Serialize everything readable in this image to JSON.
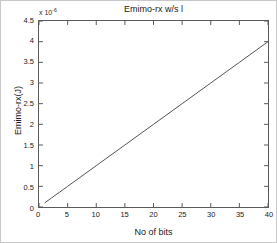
{
  "chart_data": {
    "type": "line",
    "title": "Emimo-rx w/s l",
    "xlabel": "No of bits",
    "ylabel": "Emimo-rx(J)",
    "y_multiplier_text": "x 10",
    "y_multiplier_exponent": "-6",
    "xlim": [
      0,
      40
    ],
    "ylim": [
      0,
      4.5
    ],
    "grid": false,
    "legend": null,
    "xticks": [
      0,
      5,
      10,
      15,
      20,
      25,
      30,
      35,
      40
    ],
    "xtick_labels": [
      "0",
      "5",
      "10",
      "15",
      "20",
      "25",
      "30",
      "35",
      "40"
    ],
    "yticks": [
      0,
      0.5,
      1,
      1.5,
      2,
      2.5,
      3,
      3.5,
      4,
      4.5
    ],
    "ytick_labels": [
      "0",
      "0.5",
      "1",
      "1.5",
      "2",
      "2.5",
      "3",
      "3.5",
      "4",
      "4.5"
    ],
    "line_color": "#555555",
    "series": [
      {
        "name": "Emimo-rx",
        "x": [
          1,
          5,
          10,
          15,
          20,
          25,
          30,
          35,
          40
        ],
        "values": [
          0.1,
          0.5,
          1.0,
          1.5,
          2.0,
          2.5,
          3.0,
          3.5,
          4.0
        ]
      }
    ]
  }
}
